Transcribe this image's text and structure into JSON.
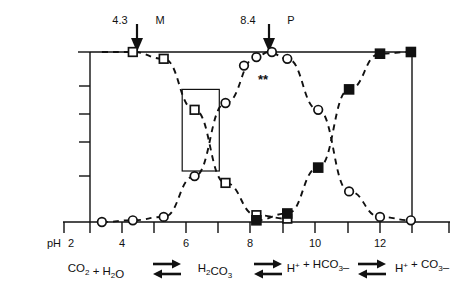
{
  "figure": {
    "type": "speciation-diagram"
  },
  "annotations": {
    "left_marker": {
      "value": "4.3",
      "letter": "M"
    },
    "right_marker": {
      "value": "8.4",
      "letter": "P"
    },
    "asterisks": "**"
  },
  "axis": {
    "x_prefix": "pH",
    "x_first_label": "2",
    "x_labels": [
      "2",
      "4",
      "6",
      "8",
      "10",
      "12"
    ],
    "x_label_values": [
      2,
      4,
      6,
      8,
      10,
      12
    ],
    "x_min": 1,
    "x_max": 13.6,
    "y_tick_count": 5
  },
  "equation": {
    "terms": [
      {
        "parts": [
          {
            "t": "CO",
            "k": "n"
          },
          {
            "t": "2",
            "k": "sub"
          },
          {
            "t": " + H",
            "k": "n"
          },
          {
            "t": "2",
            "k": "sub"
          },
          {
            "t": "O",
            "k": "n"
          }
        ]
      },
      {
        "parts": [
          {
            "t": "H",
            "k": "n"
          },
          {
            "t": "2",
            "k": "sub"
          },
          {
            "t": "CO",
            "k": "n"
          },
          {
            "t": "3",
            "k": "sub"
          }
        ]
      },
      {
        "parts": [
          {
            "t": "H",
            "k": "n"
          },
          {
            "t": "+",
            "k": "sup"
          },
          {
            "t": " + HCO",
            "k": "n"
          },
          {
            "t": "3",
            "k": "sub"
          },
          {
            "t": "–",
            "k": "n"
          }
        ]
      },
      {
        "parts": [
          {
            "t": "H",
            "k": "n"
          },
          {
            "t": "+",
            "k": "sup"
          },
          {
            "t": " + CO",
            "k": "n"
          },
          {
            "t": "3",
            "k": "sub"
          },
          {
            "t": "–",
            "k": "n"
          }
        ]
      }
    ],
    "arrow_symbol": "equilibrium-double-arrow",
    "arrow_count": 3
  },
  "chart_data": {
    "type": "line",
    "xlabel": "pH",
    "ylabel": "",
    "xlim": [
      1,
      13.6
    ],
    "ylim": [
      0,
      100
    ],
    "grid": false,
    "legend": "none",
    "marker_legend": {
      "open-square": "species-1 (CO2 / H2CO3)",
      "open-circle": "species-2 (HCO3-)",
      "filled-square": "species-3 (CO3 2-)"
    },
    "series": [
      {
        "name": "CO2 + H2O / H2CO3",
        "marker": "open-square",
        "x": [
          3,
          4,
          5,
          6,
          7,
          8,
          9
        ],
        "y": [
          100,
          100,
          96,
          66,
          23,
          4,
          2
        ]
      },
      {
        "name": "H+ + HCO3-",
        "marker": "open-circle",
        "x": [
          3,
          4,
          5,
          6,
          7,
          8,
          8.4,
          9,
          10,
          11,
          12,
          13
        ],
        "y": [
          0,
          1,
          3,
          27,
          70,
          97,
          100,
          96,
          66,
          18,
          3,
          1
        ]
      },
      {
        "name": "H+ + CO3-",
        "marker": "filled-square",
        "x": [
          8,
          9,
          10,
          11,
          12,
          13
        ],
        "y": [
          1,
          5,
          32,
          78,
          99,
          100
        ]
      }
    ],
    "markers": [
      {
        "series": 0,
        "x": 4,
        "y": 100
      },
      {
        "series": 0,
        "x": 5,
        "y": 96
      },
      {
        "series": 0,
        "x": 6,
        "y": 66
      },
      {
        "series": 0,
        "x": 7,
        "y": 23
      },
      {
        "series": 0,
        "x": 8,
        "y": 4
      },
      {
        "series": 0,
        "x": 9,
        "y": 2
      },
      {
        "series": 1,
        "x": 3,
        "y": 0
      },
      {
        "series": 1,
        "x": 4,
        "y": 1
      },
      {
        "series": 1,
        "x": 5,
        "y": 3
      },
      {
        "series": 1,
        "x": 6,
        "y": 27
      },
      {
        "series": 1,
        "x": 7,
        "y": 70
      },
      {
        "series": 1,
        "x": 7.6,
        "y": 92
      },
      {
        "series": 1,
        "x": 8,
        "y": 97
      },
      {
        "series": 1,
        "x": 8.5,
        "y": 100
      },
      {
        "series": 1,
        "x": 9,
        "y": 96
      },
      {
        "series": 1,
        "x": 10,
        "y": 66
      },
      {
        "series": 1,
        "x": 11,
        "y": 18
      },
      {
        "series": 1,
        "x": 12,
        "y": 3
      },
      {
        "series": 1,
        "x": 13,
        "y": 1
      },
      {
        "series": 2,
        "x": 8,
        "y": 1
      },
      {
        "series": 2,
        "x": 9,
        "y": 5
      },
      {
        "series": 2,
        "x": 10,
        "y": 32
      },
      {
        "series": 2,
        "x": 11,
        "y": 78
      },
      {
        "series": 2,
        "x": 12,
        "y": 99
      },
      {
        "series": 2,
        "x": 13,
        "y": 100
      }
    ],
    "highlight_box": {
      "x0": 5.6,
      "x1": 6.8,
      "y0": 30,
      "y1": 78
    },
    "pointer_annotations": [
      {
        "label": "M",
        "value": "4.3",
        "x": 4.3
      },
      {
        "label": "P",
        "value": "8.4",
        "x": 8.4
      }
    ]
  },
  "colors": {
    "ink": "#111111",
    "paper": "#ffffff"
  }
}
